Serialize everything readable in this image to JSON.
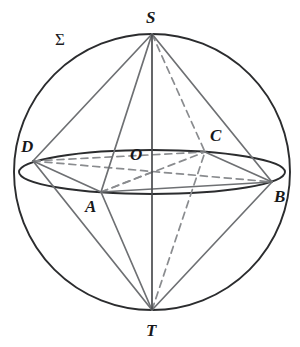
{
  "figure": {
    "name": "sphere-with-inscribed-bipyramid",
    "background_color": "#ffffff",
    "width": 300,
    "height": 347
  },
  "colors": {
    "outline": "#2b2c2e",
    "solid_edge": "#6e7073",
    "hidden_edge": "#8a8c8f",
    "axis": "#4a4c4f",
    "label": "#17181a"
  },
  "labels": {
    "surface": {
      "text": "Σ",
      "x": 55,
      "y": 31
    },
    "apex_top": {
      "text": "S",
      "x": 146,
      "y": 9
    },
    "apex_bottom": {
      "text": "T",
      "x": 146,
      "y": 322
    },
    "center": {
      "text": "O",
      "x": 130,
      "y": 146
    },
    "vertex_a": {
      "text": "A",
      "x": 85,
      "y": 198
    },
    "vertex_b": {
      "text": "B",
      "x": 274,
      "y": 188
    },
    "vertex_c": {
      "text": "C",
      "x": 210,
      "y": 127
    },
    "vertex_d": {
      "text": "D",
      "x": 21,
      "y": 138
    }
  },
  "geometry": {
    "sphere": {
      "cx": 152,
      "cy": 172,
      "r": 138
    },
    "equator": {
      "cx": 152,
      "cy": 172,
      "rx": 133,
      "ry": 22
    },
    "points": {
      "S": {
        "x": 152,
        "y": 34
      },
      "T": {
        "x": 152,
        "y": 310
      },
      "O": {
        "x": 152,
        "y": 172
      },
      "A": {
        "x": 101,
        "y": 192
      },
      "B": {
        "x": 272,
        "y": 182
      },
      "C": {
        "x": 205,
        "y": 152
      },
      "D": {
        "x": 33,
        "y": 161
      }
    },
    "solid_edges": [
      [
        "S",
        "D"
      ],
      [
        "S",
        "A"
      ],
      [
        "S",
        "B"
      ],
      [
        "T",
        "D"
      ],
      [
        "T",
        "A"
      ],
      [
        "T",
        "B"
      ],
      [
        "S",
        "T"
      ],
      [
        "D",
        "A"
      ],
      [
        "A",
        "B"
      ],
      [
        "C",
        "B"
      ]
    ],
    "hidden_edges": [
      [
        "S",
        "C"
      ],
      [
        "T",
        "C"
      ],
      [
        "D",
        "C"
      ],
      [
        "A",
        "C"
      ],
      [
        "D",
        "B"
      ],
      [
        "O",
        "A"
      ],
      [
        "O",
        "D"
      ]
    ],
    "dash_pattern": "7 5"
  }
}
